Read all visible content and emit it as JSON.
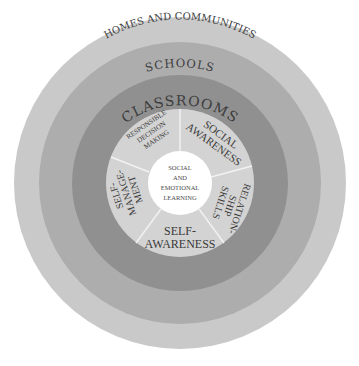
{
  "diagram": {
    "rings": [
      {
        "label": "HOMES AND COMMUNITIES",
        "color": "#c9c9c9"
      },
      {
        "label": "SCHOOLS",
        "color": "#adadad"
      },
      {
        "label": "CLASSROOMS",
        "color": "#909090"
      }
    ],
    "competencies": [
      {
        "lines": [
          "SOCIAL",
          "AWARENESS"
        ]
      },
      {
        "lines": [
          "RELATION-",
          "SHIP",
          "SKILLS"
        ]
      },
      {
        "lines": [
          "SELF-",
          "AWARENESS"
        ]
      },
      {
        "lines": [
          "SELF-",
          "MANAGE-",
          "MENT"
        ]
      },
      {
        "lines": [
          "RESPONSIBLE",
          "DECISION",
          "MAKING"
        ]
      }
    ],
    "wedge_color": "#d3d3d3",
    "center": {
      "lines": [
        "SOCIAL",
        "AND",
        "EMOTIONAL",
        "LEARNING"
      ],
      "color": "#ffffff"
    }
  }
}
